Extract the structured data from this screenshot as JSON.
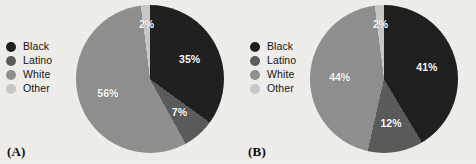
{
  "figure": {
    "background_color": "#f1efec",
    "category_colors": {
      "Black": "#1e1e1e",
      "Latino": "#5a5a5a",
      "White": "#8f8f8f",
      "Other": "#c8c8c8"
    },
    "legend_labels": [
      "Black",
      "Latino",
      "White",
      "Other"
    ],
    "panels": [
      {
        "tag": "(A)"
      },
      {
        "tag": "(B)"
      }
    ]
  },
  "chart_data": [
    {
      "type": "pie",
      "title": "(A)",
      "categories": [
        "Black",
        "Latino",
        "White",
        "Other"
      ],
      "values": [
        35,
        7,
        56,
        2
      ],
      "labels": [
        "35%",
        "7%",
        "56%",
        "2%"
      ],
      "colors": [
        "#1e1e1e",
        "#5a5a5a",
        "#8f8f8f",
        "#c8c8c8"
      ],
      "legend_position": "left",
      "start_angle_deg": 0,
      "direction": "clockwise",
      "units": "percent"
    },
    {
      "type": "pie",
      "title": "(B)",
      "categories": [
        "Black",
        "Latino",
        "White",
        "Other"
      ],
      "values": [
        41,
        12,
        44,
        2
      ],
      "labels": [
        "41%",
        "12%",
        "44%",
        "2%"
      ],
      "colors": [
        "#1e1e1e",
        "#5a5a5a",
        "#8f8f8f",
        "#c8c8c8"
      ],
      "legend_position": "left",
      "start_angle_deg": 0,
      "direction": "clockwise",
      "units": "percent"
    }
  ]
}
